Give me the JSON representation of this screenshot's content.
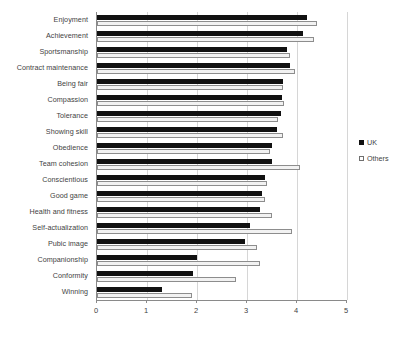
{
  "chart_data": {
    "type": "bar",
    "orientation": "horizontal",
    "title": "",
    "subtitle": "",
    "xlabel": "",
    "ylabel": "",
    "xlim": [
      0,
      5
    ],
    "xticks": [
      "0",
      "1",
      "2",
      "3",
      "4",
      "5"
    ],
    "grid": true,
    "legend_position": "right",
    "categories": [
      "Enjoyment",
      "Achievement",
      "Sportsmanship",
      "Contract maintenance",
      "Being fair",
      "Compassion",
      "Tolerance",
      "Showing skill",
      "Obedience",
      "Team cohesion",
      "Conscientious",
      "Good game",
      "Health and fitness",
      "Self-actualization",
      "Pubic image",
      "Companionship",
      "Conformity",
      "Winning"
    ],
    "series": [
      {
        "name": "UK",
        "color": "#111111",
        "values": [
          4.2,
          4.12,
          3.8,
          3.85,
          3.72,
          3.7,
          3.68,
          3.6,
          3.5,
          3.5,
          3.35,
          3.3,
          3.25,
          3.05,
          2.95,
          2.0,
          1.92,
          1.3
        ]
      },
      {
        "name": "Others",
        "color": "#f2f2f2",
        "values": [
          4.4,
          4.34,
          3.86,
          3.95,
          3.72,
          3.74,
          3.62,
          3.72,
          3.46,
          4.05,
          3.4,
          3.35,
          3.5,
          3.9,
          3.2,
          3.25,
          2.78,
          1.9
        ]
      }
    ]
  },
  "legend": {
    "items": [
      {
        "label": "UK",
        "swatch": "filled-square-icon"
      },
      {
        "label": "Others",
        "swatch": "outlined-square-icon"
      }
    ]
  }
}
